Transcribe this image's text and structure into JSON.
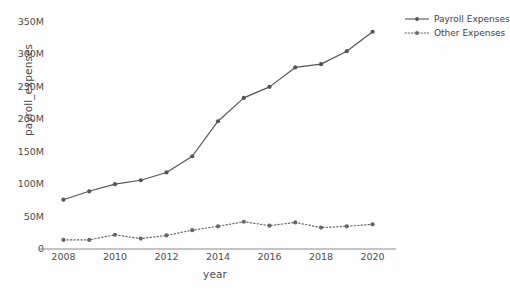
{
  "chart_data": {
    "type": "line",
    "title": "",
    "xlabel": "year",
    "ylabel": "payroll_expenses",
    "x": [
      2008,
      2009,
      2010,
      2011,
      2012,
      2013,
      2014,
      2015,
      2016,
      2017,
      2018,
      2019,
      2020
    ],
    "xlim": [
      2007.4,
      2020.6
    ],
    "ylim": [
      0,
      350000000
    ],
    "xticks": [
      2008,
      2010,
      2012,
      2014,
      2016,
      2018,
      2020
    ],
    "xticklabels": [
      "2008",
      "2010",
      "2012",
      "2014",
      "2016",
      "2018",
      "2020"
    ],
    "yticks": [
      0,
      50000000,
      100000000,
      150000000,
      200000000,
      250000000,
      300000000,
      350000000
    ],
    "yticklabels": [
      "0",
      "50M",
      "100M",
      "150M",
      "200M",
      "250M",
      "300M",
      "350M"
    ],
    "grid": false,
    "legend_position": "upper right",
    "series": [
      {
        "name": "Payroll Expenses",
        "linestyle": "solid",
        "marker": "circle",
        "color": "#555555",
        "values": [
          76000000,
          89000000,
          100000000,
          106000000,
          118000000,
          143000000,
          197000000,
          233000000,
          250000000,
          280000000,
          285000000,
          305000000,
          335000000
        ]
      },
      {
        "name": "Other Expenses",
        "linestyle": "dotted",
        "marker": "circle",
        "color": "#666666",
        "values": [
          14000000,
          14000000,
          22000000,
          16000000,
          21000000,
          29000000,
          35000000,
          42000000,
          36000000,
          41000000,
          33000000,
          35000000,
          38000000
        ]
      }
    ]
  },
  "legend": {
    "items": [
      {
        "label": "Payroll Expenses"
      },
      {
        "label": "Other Expenses"
      }
    ]
  },
  "colors": {
    "background": "#fefefe",
    "axis": "#8a8a8a",
    "text": "#4a4a4a",
    "payroll": "#555555",
    "other": "#666666"
  }
}
